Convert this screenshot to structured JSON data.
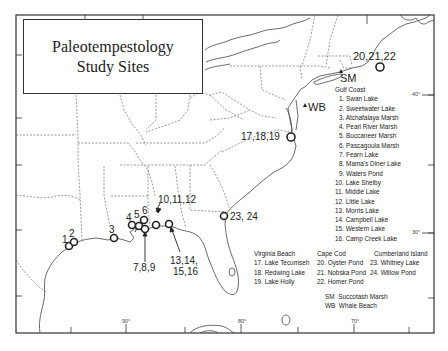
{
  "title": {
    "line1": "Paleotempestology",
    "line2": "Study Sites"
  },
  "site_markers": [
    {
      "label": "1",
      "x": 69,
      "y": 246
    },
    {
      "label": "2",
      "x": 74,
      "y": 242
    },
    {
      "label": "3",
      "x": 114,
      "y": 238
    },
    {
      "label": "4",
      "x": 132,
      "y": 226
    },
    {
      "label": "5",
      "x": 139,
      "y": 226
    },
    {
      "label": "6",
      "x": 144,
      "y": 221
    },
    {
      "label": "7,8,9",
      "x": 145,
      "y": 229
    },
    {
      "label": "10,11,12",
      "x": 156,
      "y": 225
    },
    {
      "label": "13,14,15,16",
      "x": 170,
      "y": 224
    },
    {
      "label": "17,18,19",
      "x": 292,
      "y": 137
    },
    {
      "label": "20,21,22",
      "x": 381,
      "y": 67
    },
    {
      "label": "23, 24",
      "x": 225,
      "y": 217
    }
  ],
  "map_labels": {
    "sites_1": "1",
    "sites_2": "2",
    "sites_3": "3",
    "sites_4": "4",
    "sites_5": "5",
    "sites_6": "6",
    "sites_7_8_9": "7,8,9",
    "sites_10_11_12": "10,11,12",
    "sites_13_16_a": "13,14,",
    "sites_13_16_b": "15,16",
    "sites_17_18_19": "17,18,19",
    "sites_20_21_22": "20,21,22",
    "sites_23_24": "23, 24",
    "sm": "SM",
    "wb": "WB"
  },
  "graticule": {
    "lat_40": "40°",
    "lat_30": "30°",
    "lon_90": "90°",
    "lon_80": "80°",
    "lon_70": "70°"
  },
  "legend": {
    "gulf_coast": {
      "heading": "Gulf Coast",
      "items": [
        "1. Swan Lake",
        "2. Sweetwater Lake",
        "3. Atchafalaya Marsh",
        "4. Pearl River Marsh",
        "5. Buccaneer Marsh",
        "6. Pascagoula Marsh",
        "7. Fearn Lake",
        "8. Mama's Diner Lake",
        "9. Waters Pond",
        "10. Lake Shelby",
        "11. Middle Lake",
        "12. Little Lake",
        "13. Morris Lake",
        "14. Campbell Lake",
        "15. Western Lake",
        "16. Camp Creek Lake"
      ]
    },
    "virginia_beach": {
      "heading": "Virginia Beach",
      "items": [
        "17. Lake Tecumseh",
        "18. Redwing Lake",
        "19. Lake Holly"
      ]
    },
    "cape_cod": {
      "heading": "Cape Cod",
      "items": [
        "20. Oyster Pond",
        "21. Nobska Pond",
        "22. Homer Pond"
      ]
    },
    "cumberland_island": {
      "heading": "Cumberland Island",
      "items": [
        "23. Whitney Lake",
        "24. Willow Pond"
      ]
    },
    "abbreviations": [
      {
        "code": "SM",
        "name": "Succotash Marsh"
      },
      {
        "code": "WB",
        "name": "Whale Beach"
      }
    ]
  }
}
